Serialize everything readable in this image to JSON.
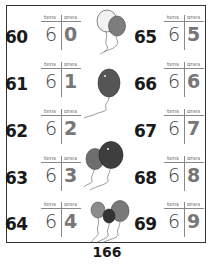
{
  "worksheet": {
    "column_headers": {
      "tens": "tens",
      "ones": "ones"
    },
    "left_column": [
      {
        "number": "60",
        "tens": "6",
        "ones": "0"
      },
      {
        "number": "61",
        "tens": "6",
        "ones": "1"
      },
      {
        "number": "62",
        "tens": "6",
        "ones": "2"
      },
      {
        "number": "63",
        "tens": "6",
        "ones": "3"
      },
      {
        "number": "64",
        "tens": "6",
        "ones": "4"
      }
    ],
    "right_column": [
      {
        "number": "65",
        "tens": "6",
        "ones": "5"
      },
      {
        "number": "66",
        "tens": "6",
        "ones": "6"
      },
      {
        "number": "67",
        "tens": "6",
        "ones": "7"
      },
      {
        "number": "68",
        "tens": "6",
        "ones": "8"
      },
      {
        "number": "69",
        "tens": "6",
        "ones": "9"
      }
    ],
    "illustrations": [
      "balloons-pair-icon",
      "balloon-single-icon",
      "balloons-pair-dark-icon",
      "balloons-trio-icon"
    ]
  },
  "page_number": "166"
}
